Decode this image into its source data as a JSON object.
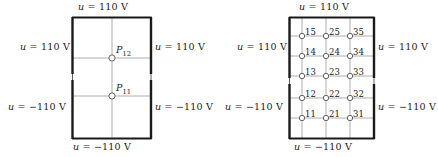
{
  "figure": {
    "type": "finite-difference-grid-diagram",
    "panels": [
      {
        "id": "left",
        "name": "coarse-grid-panel",
        "boundary_labels": {
          "top": "u = 110 V",
          "left_upper": "u = 110 V",
          "right_upper": "u = 110 V",
          "left_lower": "u = −110 V",
          "right_lower": "u = −110 V",
          "bottom": "u = −110 V"
        },
        "nodes": [
          {
            "id": "P12",
            "base": "P",
            "sub": "12",
            "x": 112,
            "y": 58
          },
          {
            "id": "P11",
            "base": "P",
            "sub": "11",
            "x": 112,
            "y": 96
          }
        ]
      },
      {
        "id": "right",
        "name": "fine-grid-panel",
        "boundary_labels": {
          "top": "u = 110 V",
          "left_upper": "u = 110 V",
          "right_upper": "u = 110 V",
          "left_lower": "u = −110 V",
          "right_lower": "u = −110 V",
          "bottom": "u = −110 V"
        },
        "node_numbers": [
          "15",
          "25",
          "35",
          "14",
          "24",
          "34",
          "13",
          "23",
          "33",
          "12",
          "22",
          "32",
          "11",
          "21",
          "31"
        ]
      }
    ],
    "colors": {
      "boundary_stroke": "#1a1a1a",
      "grid_stroke": "#9a9a9a",
      "node_fill": "#ffffff",
      "node_stroke": "#555555",
      "text": "#1a1a1a",
      "background": "#ffffff"
    }
  }
}
